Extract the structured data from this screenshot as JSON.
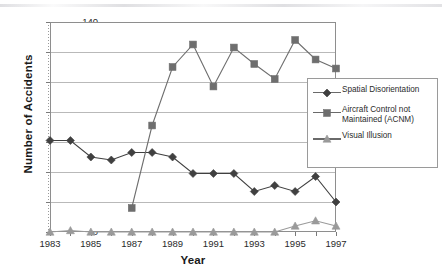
{
  "chart_data": {
    "type": "line",
    "title": "",
    "xlabel": "Year",
    "ylabel": "Number of Accidents",
    "x": [
      1983,
      1984,
      1985,
      1986,
      1987,
      1988,
      1989,
      1990,
      1991,
      1992,
      1993,
      1994,
      1995,
      1996,
      1997
    ],
    "categories": [
      "1983",
      "1984",
      "1985",
      "1986",
      "1987",
      "1988",
      "1989",
      "1990",
      "1991",
      "1992",
      "1993",
      "1994",
      "1995",
      "1996",
      "1997"
    ],
    "xtick_labels": [
      "1983",
      "1985",
      "1987",
      "1989",
      "1991",
      "1993",
      "1995",
      "1997"
    ],
    "ytick_labels": [
      "0",
      "20",
      "40",
      "60",
      "80",
      "100",
      "120",
      "140"
    ],
    "ylim": [
      0,
      140
    ],
    "xlim": [
      1983,
      1997
    ],
    "grid": true,
    "legend_position": "inside-right",
    "series": [
      {
        "name": "Spatial Disorientation",
        "marker": "diamond",
        "color": "#404040",
        "values": [
          61,
          61,
          50,
          48,
          53,
          53,
          50,
          39,
          39,
          39,
          27,
          31,
          27,
          37,
          20
        ]
      },
      {
        "name": "Aircraft Control not Maintained (ACNM)",
        "marker": "square",
        "color": "#6e6e6e",
        "values": [
          null,
          null,
          null,
          null,
          16,
          71,
          110,
          125,
          97,
          123,
          112,
          102,
          128,
          115,
          109
        ]
      },
      {
        "name": "Visual Illusion",
        "marker": "triangle",
        "color": "#9a9a9a",
        "values": [
          0,
          1,
          0,
          0,
          0,
          0,
          0,
          0,
          0,
          0,
          0,
          0,
          4,
          7.5,
          4
        ]
      }
    ]
  },
  "axes": {
    "y_title": "Number of Accidents",
    "x_title": "Year"
  },
  "legend": {
    "items": [
      {
        "label": "Spatial Disorientation",
        "label_line2": "",
        "marker": "diamond-icon"
      },
      {
        "label": "Aircraft Control not",
        "label_line2": "Maintained (ACNM)",
        "marker": "square-icon"
      },
      {
        "label": "Visual Illusion",
        "label_line2": "",
        "marker": "triangle-icon"
      }
    ]
  }
}
